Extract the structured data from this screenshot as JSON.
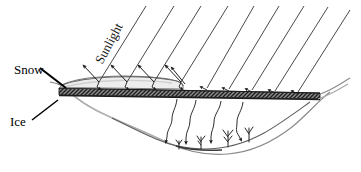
{
  "diagram": {
    "type": "schematic-cross-section",
    "background_color": "#ffffff",
    "labels": [
      {
        "id": "sunlight",
        "text": "Sunlight",
        "rotation_deg": -62,
        "x": 110,
        "y": 44
      },
      {
        "id": "snow",
        "text": "Snow",
        "x": 14,
        "y": 64
      },
      {
        "id": "ice",
        "text": "Ice",
        "x": 10,
        "y": 116
      }
    ],
    "layers": {
      "snow": {
        "name": "Snow",
        "fill_color": "#e9e9e9",
        "stroke_color": "#6b6b6b"
      },
      "ice": {
        "name": "Ice",
        "fill_color": "#5a5a5a",
        "hatch_color": "#2a2a2a",
        "stroke_color": "#2b2b2b"
      },
      "water": {
        "name": "Water",
        "fill_color": "#ffffff",
        "stroke_color": "#7a7a7a"
      },
      "lakebed": {
        "name": "Lake bed",
        "stroke_color": "#4a4a4a"
      }
    },
    "sunlight_rays": {
      "count": 9,
      "stroke_color": "#3b3b3b",
      "angle_deg": 62,
      "reflected_count": 5,
      "transmitted_count": 4,
      "description": "Parallel incident solar rays; left rays reflect off snow, right rays penetrate bare ice and scatter into the water column"
    },
    "reflected_arrows": {
      "count": 5,
      "stroke_color": "#1a1a1a",
      "direction": "up-left"
    },
    "transmitted_arrows": {
      "count": 4,
      "stroke_color": "#1a1a1a",
      "direction": "down",
      "style": "wiggly"
    },
    "plants": {
      "count": 4,
      "stroke_color": "#2b2b2b",
      "description": "Benthic aquatic vegetation on lake bed"
    }
  }
}
